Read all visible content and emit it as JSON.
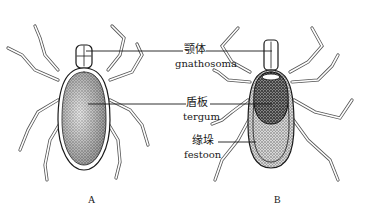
{
  "figure": {
    "labels": {
      "gnathosoma": {
        "cn": "颚体",
        "en": "gnathosoma"
      },
      "tergum": {
        "cn": "盾板",
        "en": "tergum"
      },
      "festoon": {
        "cn": "缘垛",
        "en": "festoon"
      }
    },
    "panels": [
      {
        "letter": "A"
      },
      {
        "letter": "B"
      }
    ],
    "colors": {
      "ink": "#1a1a1a",
      "stipple_light": "#bdbdbd",
      "stipple_dark": "#3a3a3a",
      "background": "#ffffff"
    }
  }
}
